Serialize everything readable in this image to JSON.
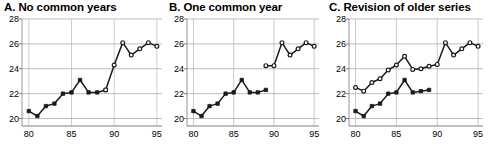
{
  "chart_data": [
    {
      "type": "line",
      "title": "A. No common years",
      "xlabel": "",
      "ylabel": "",
      "xlim": [
        79.2,
        95.6
      ],
      "ylim": [
        19.4,
        28
      ],
      "xticks": [
        80,
        85,
        90,
        95
      ],
      "yticks": [
        20,
        22,
        24,
        26,
        28
      ],
      "grid": "horizontal",
      "legend": "none",
      "series": [
        {
          "name": "Old series",
          "marker": "filled-square",
          "x": [
            80,
            81,
            82,
            83,
            84,
            85,
            86,
            87,
            88,
            89
          ],
          "values": [
            20.6,
            20.2,
            21.0,
            21.2,
            22.0,
            22.1,
            23.1,
            22.1,
            22.1,
            22.3
          ]
        },
        {
          "name": "New series",
          "marker": "open-circle",
          "x": [
            89,
            90,
            91,
            92,
            93,
            94,
            95
          ],
          "values": [
            22.3,
            24.3,
            26.1,
            25.1,
            25.6,
            26.1,
            25.8
          ]
        }
      ]
    },
    {
      "type": "line",
      "title": "B. One common year",
      "xlabel": "",
      "ylabel": "",
      "xlim": [
        79.2,
        95.6
      ],
      "ylim": [
        19.4,
        28
      ],
      "xticks": [
        80,
        85,
        90,
        95
      ],
      "yticks": [
        20,
        22,
        24,
        26,
        28
      ],
      "grid": "horizontal",
      "legend": "none",
      "series": [
        {
          "name": "Old series",
          "marker": "filled-square",
          "x": [
            80,
            81,
            82,
            83,
            84,
            85,
            86,
            87,
            88,
            89
          ],
          "values": [
            20.6,
            20.2,
            21.0,
            21.2,
            22.0,
            22.1,
            23.1,
            22.1,
            22.1,
            22.3
          ]
        },
        {
          "name": "New series",
          "marker": "open-circle",
          "x": [
            89,
            90,
            91,
            92,
            93,
            94,
            95
          ],
          "values": [
            24.25,
            24.25,
            26.1,
            25.1,
            25.6,
            26.1,
            25.8
          ]
        }
      ]
    },
    {
      "type": "line",
      "title": "C. Revision of older series",
      "xlabel": "",
      "ylabel": "",
      "xlim": [
        79.2,
        95.6
      ],
      "ylim": [
        19.4,
        28
      ],
      "xticks": [
        80,
        85,
        90,
        95
      ],
      "yticks": [
        20,
        22,
        24,
        26,
        28
      ],
      "grid": "horizontal",
      "legend": "none",
      "series": [
        {
          "name": "Old series",
          "marker": "filled-square",
          "x": [
            80,
            81,
            82,
            83,
            84,
            85,
            86,
            87,
            88,
            89
          ],
          "values": [
            20.6,
            20.2,
            21.0,
            21.2,
            22.0,
            22.1,
            23.1,
            22.1,
            22.2,
            22.3
          ]
        },
        {
          "name": "Revised series",
          "marker": "open-circle",
          "x": [
            80,
            81,
            82,
            83,
            84,
            85,
            86,
            87,
            88,
            89,
            90,
            91,
            92,
            93,
            94,
            95
          ],
          "values": [
            22.5,
            22.2,
            22.9,
            23.2,
            23.9,
            24.3,
            25.0,
            23.95,
            24.0,
            24.2,
            24.35,
            26.1,
            25.1,
            25.6,
            26.1,
            25.8
          ]
        }
      ]
    }
  ],
  "style": {
    "line_color": "#1a1a1a",
    "grid_color": "#b0b0b0",
    "axis_color": "#808080",
    "marker_fill": "#1a1a1a",
    "marker_open_fill": "#ffffff"
  }
}
